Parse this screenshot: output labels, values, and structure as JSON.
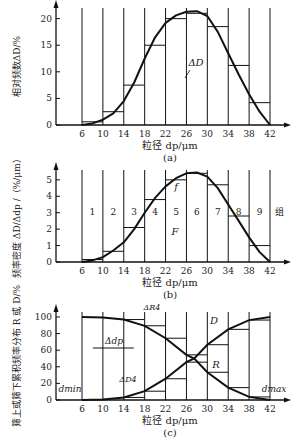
{
  "chart_data": [
    {
      "id": "a",
      "type": "bar",
      "caption": "(a)",
      "xlabel": "粒径 dp/μm",
      "ylabel": "相对频数ΔD/%",
      "x_ticks": [
        6,
        10,
        14,
        18,
        22,
        26,
        30,
        34,
        38,
        42
      ],
      "y_ticks": [
        0,
        5,
        10,
        15,
        20
      ],
      "ylim": [
        0,
        22
      ],
      "xlim": [
        0,
        44
      ],
      "bins": [
        [
          6,
          10
        ],
        [
          10,
          14
        ],
        [
          14,
          18
        ],
        [
          18,
          22
        ],
        [
          22,
          26
        ],
        [
          26,
          30
        ],
        [
          30,
          34
        ],
        [
          34,
          38
        ],
        [
          38,
          42
        ]
      ],
      "values": [
        0.6,
        2.5,
        7.5,
        15,
        20,
        21,
        18.5,
        11.2,
        4.2
      ],
      "curve": {
        "name": "ΔD",
        "x": [
          6,
          8,
          10,
          12,
          14,
          16,
          18,
          20,
          22,
          24,
          26,
          28,
          30,
          32,
          34,
          36,
          38,
          40,
          42
        ],
        "y": [
          0,
          0.3,
          1,
          2.2,
          4.5,
          8,
          12.5,
          16.5,
          19.2,
          20.6,
          21.3,
          21.4,
          20.5,
          17.5,
          13.5,
          9.5,
          5.8,
          2.5,
          0
        ]
      },
      "annotations": [
        "ΔD"
      ]
    },
    {
      "id": "b",
      "type": "bar",
      "caption": "(b)",
      "xlabel": "粒径 dp/μm",
      "ylabel": "频率密度 ΔD/Δdp /（%/μm）",
      "x_ticks": [
        6,
        10,
        14,
        18,
        22,
        26,
        30,
        34,
        38,
        42
      ],
      "y_ticks": [
        0,
        1,
        2,
        3,
        4,
        5
      ],
      "ylim": [
        0,
        5.5
      ],
      "xlim": [
        0,
        44
      ],
      "bins": [
        [
          6,
          10
        ],
        [
          10,
          14
        ],
        [
          14,
          18
        ],
        [
          18,
          22
        ],
        [
          22,
          26
        ],
        [
          26,
          30
        ],
        [
          30,
          34
        ],
        [
          34,
          38
        ],
        [
          38,
          42
        ]
      ],
      "values": [
        0.15,
        0.65,
        2.1,
        3.8,
        5.0,
        5.4,
        4.7,
        2.8,
        1.0
      ],
      "group_labels": [
        "1",
        "2",
        "3",
        "4",
        "5",
        "6",
        "7",
        "8",
        "9"
      ],
      "group_title": "组",
      "curve": {
        "name": "f",
        "x": [
          6,
          8,
          10,
          12,
          14,
          16,
          18,
          20,
          22,
          24,
          26,
          28,
          30,
          32,
          34,
          36,
          38,
          40,
          42
        ],
        "y": [
          0,
          0.1,
          0.3,
          0.7,
          1.2,
          2.0,
          3.0,
          3.9,
          4.6,
          5.1,
          5.4,
          5.45,
          5.2,
          4.5,
          3.5,
          2.5,
          1.5,
          0.6,
          0
        ]
      },
      "annotations": [
        "f",
        "F"
      ]
    },
    {
      "id": "c",
      "type": "line",
      "caption": "(c)",
      "xlabel": "粒径 dp/μm",
      "ylabel": "筛上或筛下累积频率分布 R 或 D/%",
      "x_ticks": [
        6,
        10,
        14,
        18,
        22,
        26,
        30,
        34,
        38,
        42
      ],
      "y_ticks": [
        0,
        20,
        40,
        60,
        80,
        100
      ],
      "ylim": [
        0,
        105
      ],
      "xlim": [
        0,
        44
      ],
      "series": [
        {
          "name": "R",
          "x": [
            6,
            10,
            14,
            18,
            22,
            26,
            27.5,
            30,
            34,
            38,
            42
          ],
          "y": [
            100,
            99.4,
            96.9,
            89.4,
            74.4,
            54.4,
            50,
            33.4,
            14.9,
            3.7,
            0
          ]
        },
        {
          "name": "D",
          "x": [
            6,
            10,
            14,
            18,
            22,
            26,
            27.5,
            30,
            34,
            38,
            42
          ],
          "y": [
            0,
            0.6,
            3.1,
            10.6,
            25.6,
            45.6,
            50,
            66.6,
            85.1,
            96.3,
            100
          ]
        }
      ],
      "annotations": [
        "dmin",
        "dmax",
        "Δdp",
        "ΔR4",
        "ΔD4",
        "R",
        "D"
      ]
    }
  ]
}
